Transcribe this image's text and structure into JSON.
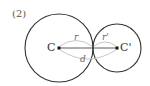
{
  "problem_number": "(2)",
  "diagram": {
    "circle_large": {
      "center_label": "C",
      "radius_label": "r",
      "cx": 59,
      "cy": 48,
      "r": 34
    },
    "circle_small": {
      "center_label": "C'",
      "radius_label": "r'",
      "cx": 117,
      "cy": 48,
      "r": 24
    },
    "distance_label": "d",
    "colors": {
      "circle": "#333333",
      "arc": "#c8c8c8",
      "text": "#333333"
    }
  }
}
